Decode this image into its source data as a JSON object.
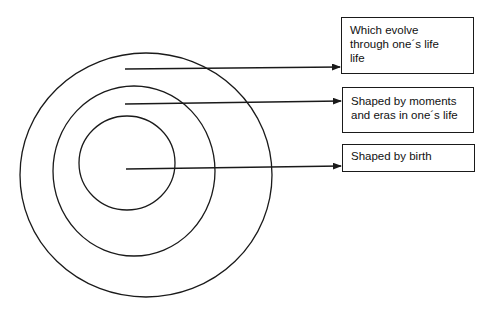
{
  "diagram": {
    "type": "concentric-circles-with-callouts",
    "circles": [
      {
        "id": "outer",
        "cx": 146,
        "cy": 175,
        "rx": 126,
        "ry": 122
      },
      {
        "id": "middle",
        "cx": 134,
        "cy": 171,
        "rx": 81,
        "ry": 85
      },
      {
        "id": "inner",
        "cx": 127,
        "cy": 163,
        "rx": 48,
        "ry": 47
      }
    ],
    "callouts": [
      {
        "id": "outer",
        "lines": [
          "Which evolve",
          "through one´s life",
          "life"
        ]
      },
      {
        "id": "middle",
        "lines": [
          "Shaped by moments",
          "and eras in one´s life"
        ]
      },
      {
        "id": "inner",
        "lines": [
          "Shaped by birth"
        ]
      }
    ],
    "colors": {
      "stroke": "#1a1a1a",
      "background": "#ffffff"
    }
  }
}
